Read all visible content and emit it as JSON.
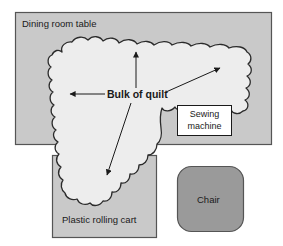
{
  "figure": {
    "type": "floor-plan-diagram",
    "background_color": "#ffffff"
  },
  "regions": {
    "dining_table": {
      "label": "Dining room table",
      "fill": "#c9c9c9",
      "stroke": "#4d4d4d",
      "x": 15,
      "y": 12,
      "width": 257,
      "height": 133
    },
    "rolling_cart": {
      "label": "Plastic rolling cart",
      "fill": "#c9c9c9",
      "stroke": "#4d4d4d",
      "x": 52,
      "y": 155,
      "width": 105,
      "height": 83
    },
    "chair": {
      "label": "Chair",
      "fill": "#9a9a9a",
      "stroke": "#4d4d4d",
      "x": 177,
      "y": 166,
      "width": 67,
      "height": 66,
      "corner_radius": 14
    },
    "quilt": {
      "label": "Bulk of quilt",
      "fill": "#ededed",
      "stroke": "#2b2b2b"
    },
    "sewing_machine": {
      "label_line1": "Sewing",
      "label_line2": "machine",
      "fill": "#ffffff",
      "stroke": "#1a1a1a",
      "x": 177,
      "y": 105,
      "width": 55,
      "height": 31
    }
  },
  "annotations": {
    "arrows": [
      {
        "name": "arrow-left",
        "from": [
          105,
          94
        ],
        "to": [
          68,
          94
        ]
      },
      {
        "name": "arrow-up",
        "from": [
          136,
          89
        ],
        "to": [
          136,
          50
        ]
      },
      {
        "name": "arrow-up-right",
        "from": [
          166,
          92
        ],
        "to": [
          222,
          67
        ]
      },
      {
        "name": "arrow-down-left",
        "from": [
          131,
          103
        ],
        "to": [
          106,
          177
        ]
      }
    ],
    "arrow_color": "#1a1a1a"
  },
  "colors": {
    "furniture_gray": "#c9c9c9",
    "chair_gray": "#9a9a9a",
    "quilt_white": "#ededed",
    "outline_dark": "#2b2b2b",
    "text": "#1a1a1a"
  }
}
